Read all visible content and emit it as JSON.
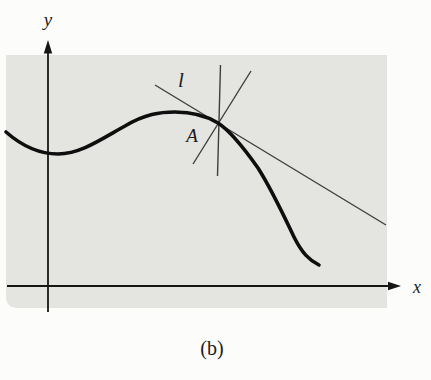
{
  "figure": {
    "caption": "(b)",
    "y_axis_label": "y",
    "x_axis_label": "x",
    "tangent_line_label": "l",
    "point_label": "A"
  },
  "colors": {
    "page-bg": "#fcfcfa",
    "panel-bg": "#e4e4e1",
    "axis": "#161616",
    "thin-line": "#3e3e3e",
    "curve": "#0e0e0e",
    "text": "#1c1c1c"
  }
}
